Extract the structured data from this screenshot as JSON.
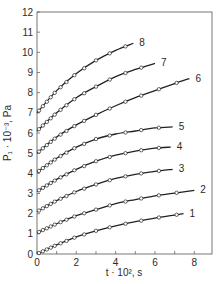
{
  "chart_data": {
    "type": "line",
    "title": "",
    "xlabel": "t · 10², s",
    "ylabel": "P₁ · 10⁻³, Pa",
    "xlim": [
      0,
      8.9
    ],
    "ylim": [
      0,
      12
    ],
    "xticks": [
      0,
      2,
      4,
      6,
      8
    ],
    "yticks": [
      0,
      1,
      2,
      3,
      4,
      5,
      6,
      7,
      8,
      9,
      10,
      11,
      12
    ],
    "grid": false,
    "legend": "curve labels at right ends",
    "markers": "open circles (experimental) with solid fitted curves",
    "series": [
      {
        "name": "1",
        "x": [
          0,
          1,
          2,
          3,
          4,
          5,
          6,
          7,
          7.45
        ],
        "y": [
          0,
          0.45,
          0.85,
          1.15,
          1.4,
          1.6,
          1.78,
          1.93,
          2.0
        ]
      },
      {
        "name": "2",
        "x": [
          0,
          1,
          2,
          3,
          4,
          5,
          6,
          7,
          8
        ],
        "y": [
          1.05,
          1.5,
          1.9,
          2.2,
          2.5,
          2.7,
          2.88,
          3.02,
          3.15
        ]
      },
      {
        "name": "3",
        "x": [
          0,
          1,
          2,
          3,
          4,
          5,
          6,
          6.9
        ],
        "y": [
          2.1,
          2.65,
          3.1,
          3.45,
          3.75,
          3.95,
          4.1,
          4.2
        ]
      },
      {
        "name": "4",
        "x": [
          0,
          1,
          2,
          3,
          4,
          5,
          6,
          6.8
        ],
        "y": [
          3.1,
          3.7,
          4.2,
          4.6,
          4.9,
          5.1,
          5.25,
          5.3
        ]
      },
      {
        "name": "5",
        "x": [
          0,
          1,
          2,
          3,
          4,
          5,
          6,
          6.9
        ],
        "y": [
          4.05,
          4.75,
          5.3,
          5.7,
          5.95,
          6.1,
          6.25,
          6.3
        ]
      },
      {
        "name": "6",
        "x": [
          0,
          1,
          2,
          3,
          4,
          5,
          6,
          7,
          7.75
        ],
        "y": [
          5.0,
          5.8,
          6.4,
          6.9,
          7.35,
          7.75,
          8.1,
          8.45,
          8.7
        ]
      },
      {
        "name": "7",
        "x": [
          0,
          1,
          2,
          3,
          4,
          5,
          6
        ],
        "y": [
          6.1,
          7.0,
          7.75,
          8.3,
          8.8,
          9.15,
          9.45
        ]
      },
      {
        "name": "8",
        "x": [
          0,
          1,
          2,
          3,
          4,
          4.9
        ],
        "y": [
          7.0,
          8.1,
          8.95,
          9.6,
          10.1,
          10.45
        ]
      }
    ]
  },
  "labels": {
    "xlabel": "t · 10², s",
    "ylabel": "P₁ · 10⁻³, Pa"
  }
}
